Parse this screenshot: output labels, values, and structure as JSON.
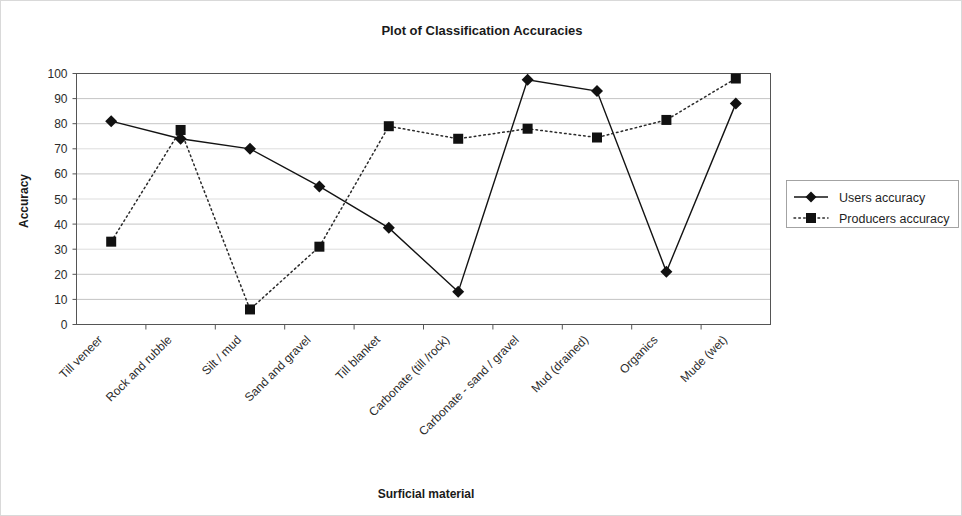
{
  "chart_data": {
    "type": "line",
    "title": "Plot of Classification Accuracies",
    "xlabel": "Surficial material",
    "ylabel": "Accuracy",
    "ylim": [
      0,
      100
    ],
    "yticks": [
      0,
      10,
      20,
      30,
      40,
      50,
      60,
      70,
      80,
      90,
      100
    ],
    "grid": true,
    "legend_position": "right",
    "categories": [
      "Till veneer",
      "Rock and rubble",
      "Silt / mud",
      "Sand and gravel",
      "Till blanket",
      "Carbonate (till /rock)",
      "Carbonate - sand / gravel",
      "Mud (drained)",
      "Organics",
      "Mude (wet)"
    ],
    "series": [
      {
        "name": "Users accuracy",
        "marker": "diamond",
        "linestyle": "solid",
        "color": "#111111",
        "values": [
          81,
          74,
          70,
          55,
          38.5,
          13,
          97.5,
          93,
          21,
          88
        ]
      },
      {
        "name": "Producers accuracy",
        "marker": "square",
        "linestyle": "dotted",
        "color": "#111111",
        "values": [
          33,
          77.5,
          6,
          31,
          79,
          74,
          78,
          74.5,
          81.5,
          98
        ]
      }
    ]
  },
  "legend": {
    "entries": [
      {
        "label": "Users accuracy"
      },
      {
        "label": "Producers accuracy"
      }
    ]
  }
}
